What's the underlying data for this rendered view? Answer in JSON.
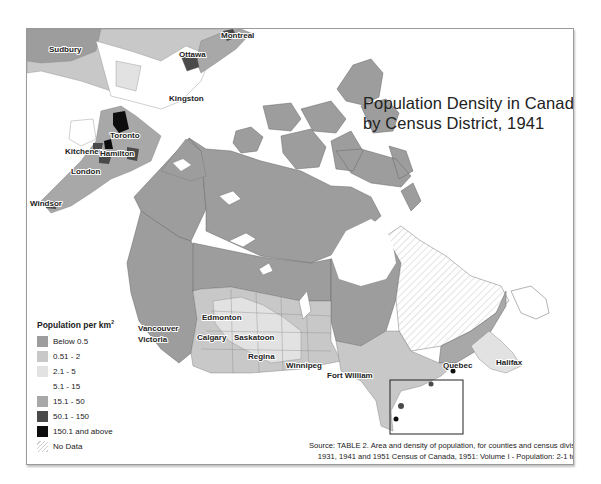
{
  "title": {
    "line1": "Population Density in Canada",
    "line2": "by Census District, 1941"
  },
  "legend": {
    "title": "Population per km",
    "title_sup": "2",
    "items": [
      {
        "label": "Below 0.5",
        "color": "#9d9d9d",
        "pattern": "solid"
      },
      {
        "label": "0.51 - 2",
        "color": "#c8c8c8",
        "pattern": "solid"
      },
      {
        "label": "2.1 - 5",
        "color": "#e2e2e2",
        "pattern": "solid"
      },
      {
        "label": "5.1 - 15",
        "color": "#ffffff",
        "pattern": "solid"
      },
      {
        "label": "15.1 - 50",
        "color": "#a8a8a8",
        "pattern": "solid"
      },
      {
        "label": "50.1 - 150",
        "color": "#4a4a4a",
        "pattern": "solid"
      },
      {
        "label": "150.1 and above",
        "color": "#0d0d0d",
        "pattern": "solid"
      },
      {
        "label": "No Data",
        "color": "#ffffff",
        "pattern": "hatched"
      }
    ]
  },
  "inset_cities": [
    "Sudbury",
    "Ottawa",
    "Montreal",
    "Kingston",
    "Toronto",
    "Kitchener",
    "Hamilton",
    "London",
    "Windsor"
  ],
  "main_cities": [
    "Vancouver",
    "Victoria",
    "Edmonton",
    "Calgary",
    "Saskatoon",
    "Regina",
    "Winnipeg",
    "Fort William",
    "Quebec",
    "Halifax"
  ],
  "source": {
    "line1": "Source: TABLE 2. Area and density of population, for counties and census divisions,",
    "line2": "1931, 1941 and 1951 Census of Canada, 1951: Volume I - Population: 2-1 to 2-4."
  }
}
